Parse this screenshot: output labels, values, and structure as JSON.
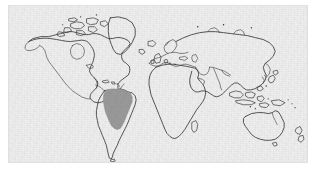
{
  "figure": {
    "type": "map",
    "projection": "equirectangular",
    "background_color": "#eeeeee",
    "frame_color": "#e0e0e0",
    "coastline_color": "#3a3a3a",
    "highlight_color": "#9a9a9a",
    "has_labels": false,
    "has_graticule": false,
    "has_legend": false,
    "has_scale_bar": false,
    "has_compass": false
  },
  "panel": {
    "x": 8,
    "y": 5,
    "width": 300,
    "height": 158
  },
  "highlight": {
    "name": "amazon-basin-region",
    "continent": "South America",
    "description": "Shaded area covering the Amazon basin of northern South America",
    "fill_color": "#9a9a9a",
    "approx_center_x": 108,
    "approx_center_y": 108
  },
  "landmasses": [
    {
      "id": "north-america",
      "label": "North America"
    },
    {
      "id": "greenland",
      "label": "Greenland"
    },
    {
      "id": "south-america",
      "label": "South America"
    },
    {
      "id": "africa",
      "label": "Africa"
    },
    {
      "id": "europe",
      "label": "Europe"
    },
    {
      "id": "asia",
      "label": "Asia"
    },
    {
      "id": "australia",
      "label": "Australia"
    },
    {
      "id": "new-zealand",
      "label": "New Zealand"
    },
    {
      "id": "japan",
      "label": "Japan"
    },
    {
      "id": "madagascar",
      "label": "Madagascar"
    },
    {
      "id": "british-isles",
      "label": "British Isles"
    },
    {
      "id": "indonesia",
      "label": "Indonesia"
    },
    {
      "id": "arctic-islands",
      "label": "Arctic islands"
    }
  ]
}
